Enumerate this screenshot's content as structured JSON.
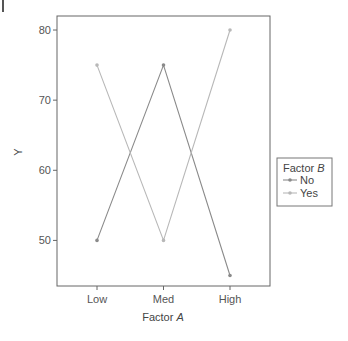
{
  "chart_data": {
    "type": "line",
    "title": "",
    "xlabel": "Factor A",
    "xlabel_plain": "Factor ",
    "xlabel_italic": "A",
    "ylabel": "Y",
    "categories": [
      "Low",
      "Med",
      "High"
    ],
    "yticks": [
      50,
      60,
      70,
      80
    ],
    "ylim": [
      43.5,
      82
    ],
    "grid": false,
    "legend": {
      "title": "Factor B",
      "title_plain": "Factor ",
      "title_italic": "B",
      "position": "right"
    },
    "series": [
      {
        "name": "No",
        "values": [
          50,
          75,
          45
        ],
        "color": "#8a8a8a"
      },
      {
        "name": "Yes",
        "values": [
          75,
          50,
          80
        ],
        "color": "#b8b8b8"
      }
    ]
  }
}
